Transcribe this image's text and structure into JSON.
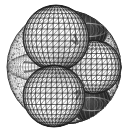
{
  "figure": {
    "title": "Wireframe mesh rendering of a multi-lobed isosurface",
    "caption": "",
    "image_width": 128,
    "image_height": 135,
    "background_color": "#ffffff",
    "line_color": "#1a1a1a",
    "shadow_color": "#555555",
    "render_style": "wireframe-triangulated-mesh",
    "has_axes": false,
    "has_legend": false,
    "has_text_labels": false
  },
  "chart_data": {
    "type": "scatter",
    "title": "Wireframe mesh rendering of a multi-lobed isosurface",
    "subtitle": "",
    "xlabel": "",
    "ylabel": "",
    "xlim": [
      0,
      128
    ],
    "ylim": [
      0,
      135
    ],
    "grid": false,
    "legend_position": "none",
    "categories": [
      "outer-shell",
      "lobe-upper-left",
      "lobe-lower-left",
      "lobe-right",
      "lobe-rear-top",
      "lobe-rear-bottom"
    ],
    "values": [
      57,
      33,
      31,
      27,
      20,
      20
    ],
    "annotations": [],
    "series": [
      {
        "name": "outer-shell",
        "role": "enclosing-sphere",
        "center": [
          64,
          67
        ],
        "radius": 57,
        "shade": "dense-stipple",
        "fill": "#ffffff",
        "stroke": "#2b2b2b",
        "mesh_density": 46
      },
      {
        "name": "lobe-upper-left",
        "role": "blob-lobe",
        "center": [
          56,
          38
        ],
        "radius": 33,
        "shade": "light",
        "fill": "#ffffff",
        "stroke": "#222222",
        "mesh_density": 17
      },
      {
        "name": "lobe-lower-left",
        "role": "blob-lobe",
        "center": [
          54,
          96
        ],
        "radius": 31,
        "shade": "light",
        "fill": "#ffffff",
        "stroke": "#222222",
        "mesh_density": 17
      },
      {
        "name": "lobe-right",
        "role": "blob-lobe",
        "center": [
          94,
          67
        ],
        "radius": 27,
        "shade": "light",
        "fill": "#ffffff",
        "stroke": "#222222",
        "mesh_density": 15
      },
      {
        "name": "lobe-rear-top",
        "role": "occluded-lobe",
        "center": [
          88,
          30
        ],
        "radius": 20,
        "shade": "dark",
        "fill": "#3d3d3d",
        "stroke": "#141414",
        "mesh_density": 11
      },
      {
        "name": "lobe-rear-bottom",
        "role": "occluded-lobe",
        "center": [
          92,
          104
        ],
        "radius": 20,
        "shade": "dark",
        "fill": "#3d3d3d",
        "stroke": "#141414",
        "mesh_density": 11
      }
    ]
  }
}
